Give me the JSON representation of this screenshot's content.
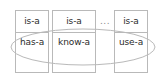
{
  "diagram": {
    "stroke_color": "#b9b9b9",
    "text_color": "#2b2b2b",
    "ellipsis_color": "#8a8a8a",
    "background_color": "#ffffff",
    "boxes": [
      {
        "top_label": "is-a",
        "bottom_label": "has-a"
      },
      {
        "top_label": "is-a",
        "bottom_label": "know-a"
      },
      {
        "top_label": "is-a",
        "bottom_label": "use-a"
      }
    ],
    "ellipsis": "...",
    "grouping_shape": "ellipse"
  }
}
